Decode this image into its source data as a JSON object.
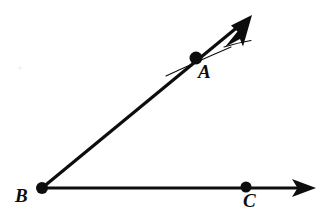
{
  "figure": {
    "type": "geometry-diagram",
    "background_color": "#ffffff",
    "stroke_color": "#0d0d0d",
    "canvas": {
      "width": 322,
      "height": 220
    },
    "labels": {
      "a": "A",
      "b": "B",
      "c": "C"
    },
    "points": [
      {
        "name": "A",
        "x": 196,
        "y": 58,
        "marker": "filled-dot",
        "radius": 6.5,
        "label": "A",
        "label_x": 198,
        "label_y": 62
      },
      {
        "name": "B",
        "x": 42,
        "y": 188,
        "marker": "filled-dot",
        "radius": 6.0,
        "label": "B",
        "label_x": 15,
        "label_y": 186
      },
      {
        "name": "C",
        "x": 246,
        "y": 187,
        "marker": "filled-dot",
        "radius": 5.5,
        "label": "C",
        "label_x": 243,
        "label_y": 191
      }
    ],
    "rays": [
      {
        "name": "ray-BA",
        "from": "B",
        "through": "A",
        "x1": 42,
        "y1": 188,
        "x2": 252,
        "y2": 15,
        "stroke_width": 3.2,
        "arrowhead": "end"
      },
      {
        "name": "ray-BC",
        "from": "B",
        "through": "C",
        "x1": 42,
        "y1": 188,
        "x2": 316,
        "y2": 188,
        "stroke_width": 3.2,
        "arrowhead": "end"
      }
    ],
    "stray_marks": [
      {
        "name": "stray-line-through-a",
        "path": "M 166 76 Q 196 62 231 47",
        "stroke_width": 1.1
      },
      {
        "name": "stray-line-near-arrowhead",
        "path": "M 225 46 Q 240 42 252 40",
        "stroke_width": 1.1
      },
      {
        "name": "background-speck",
        "x": 20,
        "y": 68,
        "radius": 1.6,
        "color": "#f0f0f0"
      }
    ]
  }
}
